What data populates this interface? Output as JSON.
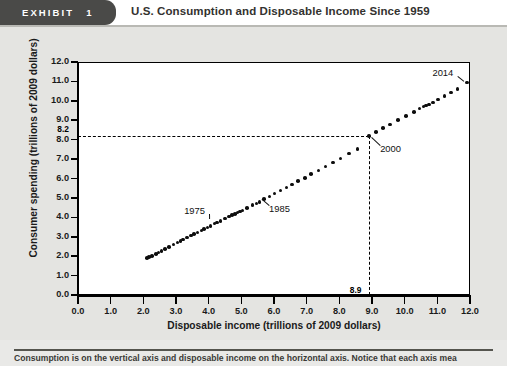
{
  "header": {
    "exhibit_word": "EXHIBIT",
    "exhibit_number": "1",
    "title": "U.S. Consumption and Disposable Income Since 1959"
  },
  "caption": {
    "text": "Consumption is on the vertical axis and disposable income on the horizontal axis. Notice that each axis mea"
  },
  "colors": {
    "tab_background": "#4a4a48",
    "page_background": "#e4e4e1",
    "plot_background": "#ffffff",
    "point_color": "#0d0d0d",
    "axis_color": "#000000"
  },
  "chart_data": {
    "type": "scatter",
    "title": "U.S. Consumption and Disposable Income Since 1959",
    "xlabel": "Disposable income (trillions of 2009 dollars)",
    "ylabel": "Consumer spending (trillions of 2009 dollars)",
    "xlim": [
      0.0,
      12.0
    ],
    "ylim": [
      0.0,
      12.0
    ],
    "grid": false,
    "legend": "none",
    "xticks": [
      "0.0",
      "1.0",
      "2.0",
      "3.0",
      "4.0",
      "5.0",
      "6.0",
      "7.0",
      "8.0",
      "9.0",
      "10.0",
      "11.0",
      "12.0"
    ],
    "yticks": [
      "0.0",
      "1.0",
      "2.0",
      "3.0",
      "4.0",
      "5.0",
      "6.0",
      "7.0",
      "8.0",
      "9.0",
      "10.0",
      "11.0",
      "12.0"
    ],
    "reference_lines": {
      "y_value": "8.2",
      "x_value": "8.9",
      "y_number": 8.2,
      "x_number": 8.9,
      "style": "dashed"
    },
    "annotations": [
      {
        "label": "1975",
        "x": 4.05,
        "y": 3.85,
        "text_x": 3.25,
        "text_y": 4.35
      },
      {
        "label": "1985",
        "x": 5.55,
        "y": 5.05,
        "text_x": 5.85,
        "text_y": 4.45
      },
      {
        "label": "2000",
        "x": 8.9,
        "y": 8.2,
        "text_x": 9.25,
        "text_y": 7.5
      },
      {
        "label": "2014",
        "x": 11.9,
        "y": 10.95,
        "text_x": 10.85,
        "text_y": 11.45
      }
    ],
    "x": [
      2.12,
      2.18,
      2.26,
      2.38,
      2.46,
      2.56,
      2.66,
      2.78,
      2.92,
      3.04,
      3.14,
      3.22,
      3.34,
      3.46,
      3.56,
      3.66,
      3.78,
      3.86,
      3.96,
      4.05,
      4.18,
      4.26,
      4.36,
      4.5,
      4.62,
      4.72,
      4.8,
      4.88,
      4.96,
      5.04,
      5.18,
      5.34,
      5.46,
      5.55,
      5.7,
      5.86,
      6.02,
      6.2,
      6.38,
      6.56,
      6.74,
      6.94,
      7.14,
      7.36,
      7.58,
      7.8,
      8.04,
      8.3,
      8.56,
      8.9,
      9.12,
      9.34,
      9.56,
      9.8,
      10.04,
      10.28,
      10.46,
      10.58,
      10.66,
      10.74,
      10.86,
      11.02,
      11.22,
      11.42,
      11.62,
      11.9
    ],
    "y": [
      1.92,
      1.96,
      2.02,
      2.12,
      2.18,
      2.28,
      2.36,
      2.48,
      2.6,
      2.7,
      2.78,
      2.86,
      2.96,
      3.06,
      3.14,
      3.22,
      3.32,
      3.4,
      3.48,
      3.56,
      3.68,
      3.74,
      3.82,
      3.94,
      4.04,
      4.12,
      4.18,
      4.24,
      4.3,
      4.36,
      4.48,
      4.62,
      4.72,
      4.8,
      4.94,
      5.08,
      5.22,
      5.38,
      5.54,
      5.7,
      5.86,
      6.04,
      6.22,
      6.42,
      6.62,
      6.82,
      7.04,
      7.28,
      7.52,
      8.2,
      8.4,
      8.6,
      8.78,
      9.0,
      9.22,
      9.44,
      9.6,
      9.7,
      9.76,
      9.82,
      9.92,
      10.06,
      10.24,
      10.42,
      10.6,
      10.95
    ]
  }
}
